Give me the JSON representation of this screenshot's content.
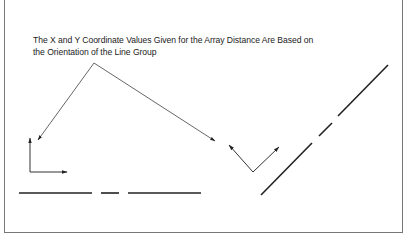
{
  "figure": {
    "caption_lines": [
      "The X and Y Coordinate Values Given for the Array Distance Are Based on",
      "the Orientation of the Line Group"
    ],
    "elements": {
      "leader_lines": {
        "apex": [
          94,
          63
        ],
        "left_target": [
          38,
          140
        ],
        "right_target": [
          215,
          141
        ]
      },
      "axis_indicator_horizontal_group": {
        "origin": [
          30,
          172
        ],
        "x_arrow_end": [
          67,
          172
        ],
        "y_arrow_end": [
          30,
          138
        ]
      },
      "axis_indicator_rotated_group": {
        "vertex": [
          253,
          172
        ],
        "left_arrow_end": [
          229,
          145
        ],
        "right_arrow_end": [
          279,
          147
        ]
      },
      "horizontal_line_group": [
        [
          [
            19,
            193
          ],
          [
            92,
            193
          ]
        ],
        [
          [
            101,
            193
          ],
          [
            119,
            193
          ]
        ],
        [
          [
            128,
            193
          ],
          [
            201,
            193
          ]
        ]
      ],
      "diagonal_line_group": [
        [
          [
            261,
            195
          ],
          [
            312,
            143
          ]
        ],
        [
          [
            319,
            136
          ],
          [
            332,
            123
          ]
        ],
        [
          [
            338,
            116
          ],
          [
            388,
            65
          ]
        ]
      ]
    },
    "colors": {
      "line": "#222222",
      "leader": "#555555",
      "frame": "#777777",
      "background": "#ffffff"
    }
  }
}
